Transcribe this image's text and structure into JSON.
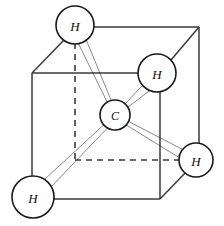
{
  "figure": {
    "molecule": "CH4",
    "background_color": "#ffffff",
    "width": 224,
    "height": 226
  },
  "atoms": {
    "center": {
      "id": "carbon-center",
      "label": "C",
      "element": "C",
      "cx": 115,
      "cy": 115,
      "r": 15,
      "fill": "#ffffff",
      "stroke": "#1a1a1a",
      "label_dx": 0,
      "label_dy": 1
    },
    "hydrogens": [
      {
        "id": "hydrogen-top-left",
        "label": "H",
        "element": "H",
        "cx": 75,
        "cy": 25,
        "r": 19,
        "fill": "#ffffff",
        "stroke": "#1a1a1a",
        "label_dx": 0,
        "label_dy": 1
      },
      {
        "id": "hydrogen-upper-right",
        "label": "H",
        "element": "H",
        "cx": 157,
        "cy": 73,
        "r": 19,
        "fill": "#ffffff",
        "stroke": "#1a1a1a",
        "label_dx": 0,
        "label_dy": 1
      },
      {
        "id": "hydrogen-right",
        "label": "H",
        "element": "H",
        "cx": 196,
        "cy": 160,
        "r": 17,
        "fill": "#ffffff",
        "stroke": "#1a1a1a",
        "label_dx": 0,
        "label_dy": 1
      },
      {
        "id": "hydrogen-bottom-left",
        "label": "H",
        "element": "H",
        "cx": 33,
        "cy": 197,
        "r": 21,
        "fill": "#ffffff",
        "stroke": "#1a1a1a",
        "label_dx": 0,
        "label_dy": 1
      }
    ]
  },
  "bonds": [
    {
      "id": "bond-c-h-top-left",
      "from": "carbon-center",
      "to": "hydrogen-top-left",
      "x1": 110,
      "y1": 103,
      "x2": 82,
      "y2": 41,
      "width": 7,
      "color": "#111111",
      "taper": "wedge"
    },
    {
      "id": "bond-c-h-upper-right",
      "from": "carbon-center",
      "to": "hydrogen-upper-right",
      "x1": 126,
      "y1": 106,
      "x2": 146,
      "y2": 88,
      "width": 7,
      "color": "#111111",
      "taper": "wedge"
    },
    {
      "id": "bond-c-h-right",
      "from": "carbon-center",
      "to": "hydrogen-right",
      "x1": 127,
      "y1": 123,
      "x2": 180,
      "y2": 153,
      "width": 7,
      "color": "#111111",
      "taper": "wedge"
    },
    {
      "id": "bond-c-h-bottom-left",
      "from": "carbon-center",
      "to": "hydrogen-bottom-left",
      "x1": 106,
      "y1": 126,
      "x2": 48,
      "y2": 183,
      "width": 8,
      "color": "#111111",
      "taper": "wedge"
    }
  ],
  "cube": {
    "stroke_color": "#3a3a3a",
    "stroke_width": 1.5,
    "hidden_dash_pattern": "6 5",
    "front_face": {
      "top_left": [
        32,
        73
      ],
      "top_right": [
        160,
        73
      ],
      "bottom_right": [
        160,
        199
      ],
      "bottom_left": [
        32,
        199
      ]
    },
    "back_face": {
      "top_left": [
        75,
        27
      ],
      "top_right": [
        199,
        27
      ],
      "bottom_right": [
        199,
        153
      ],
      "bottom_left": [
        75,
        160
      ]
    },
    "visible_edges": [
      {
        "id": "edge-front-top",
        "x1": 32,
        "y1": 73,
        "x2": 160,
        "y2": 73
      },
      {
        "id": "edge-front-left",
        "x1": 32,
        "y1": 73,
        "x2": 32,
        "y2": 199
      },
      {
        "id": "edge-front-bottom",
        "x1": 32,
        "y1": 199,
        "x2": 160,
        "y2": 199
      },
      {
        "id": "edge-front-right",
        "x1": 160,
        "y1": 73,
        "x2": 160,
        "y2": 199
      },
      {
        "id": "edge-back-top",
        "x1": 75,
        "y1": 27,
        "x2": 199,
        "y2": 27
      },
      {
        "id": "edge-back-right",
        "x1": 199,
        "y1": 27,
        "x2": 199,
        "y2": 153
      },
      {
        "id": "edge-diagonal-top-left",
        "x1": 32,
        "y1": 73,
        "x2": 64,
        "y2": 40
      },
      {
        "id": "edge-diagonal-top-right",
        "x1": 160,
        "y1": 73,
        "x2": 199,
        "y2": 27
      },
      {
        "id": "edge-diagonal-bottom-right",
        "x1": 160,
        "y1": 199,
        "x2": 188,
        "y2": 170
      }
    ],
    "hidden_edges": [
      {
        "id": "edge-hidden-back-left-vertical",
        "x1": 75,
        "y1": 43,
        "x2": 75,
        "y2": 160
      },
      {
        "id": "edge-hidden-back-bottom",
        "x1": 75,
        "y1": 160,
        "x2": 180,
        "y2": 160
      }
    ]
  }
}
